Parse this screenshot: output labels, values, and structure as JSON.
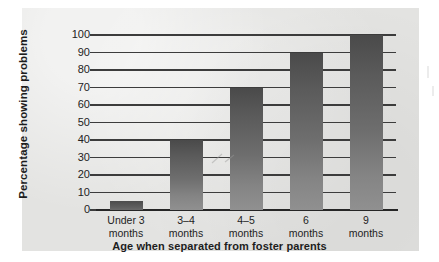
{
  "chart_data": {
    "type": "bar",
    "title": "",
    "xlabel": "Age when separated from foster parents",
    "ylabel": "Percentage showing problems",
    "categories": [
      "Under 3\nmonths",
      "3–4\nmonths",
      "4–5\nmonths",
      "6\nmonths",
      "9\nmonths"
    ],
    "category_lines": [
      [
        "Under 3",
        "months"
      ],
      [
        "3–4",
        "months"
      ],
      [
        "4–5",
        "months"
      ],
      [
        "6",
        "months"
      ],
      [
        "9",
        "months"
      ]
    ],
    "values": [
      5,
      40,
      70,
      90,
      100
    ],
    "ylim": [
      0,
      100
    ],
    "yticks": [
      0,
      10,
      20,
      30,
      40,
      50,
      60,
      70,
      80,
      90,
      100
    ],
    "ytick_labels": [
      "0",
      "10",
      "20",
      "30",
      "40",
      "50",
      "60",
      "70",
      "80",
      "90",
      "100"
    ],
    "grid": true,
    "grid_axis": "y",
    "legend": null,
    "legend_position": "none",
    "bar_color": "#6e6e6e",
    "bar_color_top": "#4a4a4a",
    "bar_color_bottom": "#909090",
    "axis_color": "#262626",
    "grid_color": "#3c3c3c",
    "panel_background": "#e3e3e1",
    "figure_background": "#ffffff",
    "text_color": "#1d1d1d"
  }
}
